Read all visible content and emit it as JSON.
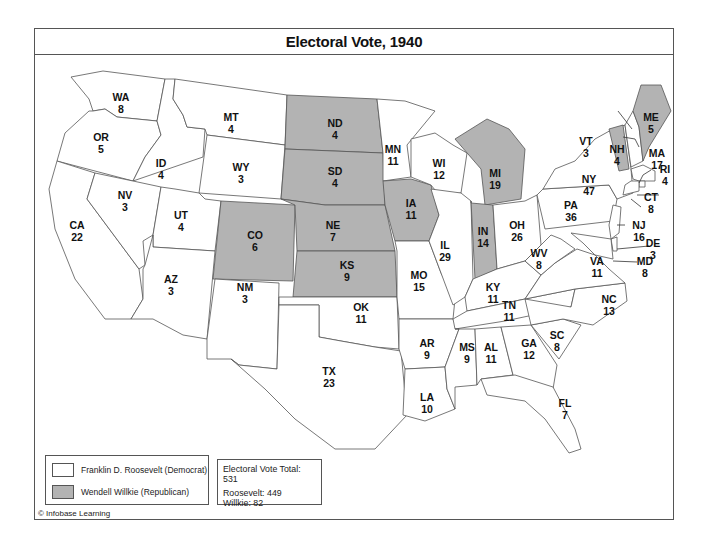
{
  "title": "Electoral Vote, 1940",
  "colors": {
    "democrat": "#ffffff",
    "republican": "#b3b3b3",
    "border": "#555555"
  },
  "legend": {
    "items": [
      {
        "label": "Franklin D. Roosevelt (Democrat)",
        "color": "#ffffff"
      },
      {
        "label": "Wendell Willkie (Republican)",
        "color": "#b3b3b3"
      }
    ]
  },
  "totals": {
    "total_label": "Electoral Vote Total: 531",
    "roosevelt_label": "Roosevelt: 449",
    "willkie_label": "Willkie: 82"
  },
  "credit": "© Infobase Learning",
  "states": [
    {
      "abbr": "WA",
      "votes": "8",
      "winner": "D"
    },
    {
      "abbr": "OR",
      "votes": "5",
      "winner": "D"
    },
    {
      "abbr": "CA",
      "votes": "22",
      "winner": "D"
    },
    {
      "abbr": "ID",
      "votes": "4",
      "winner": "D"
    },
    {
      "abbr": "NV",
      "votes": "3",
      "winner": "D"
    },
    {
      "abbr": "MT",
      "votes": "4",
      "winner": "D"
    },
    {
      "abbr": "WY",
      "votes": "3",
      "winner": "D"
    },
    {
      "abbr": "UT",
      "votes": "4",
      "winner": "D"
    },
    {
      "abbr": "AZ",
      "votes": "3",
      "winner": "D"
    },
    {
      "abbr": "CO",
      "votes": "6",
      "winner": "R"
    },
    {
      "abbr": "NM",
      "votes": "3",
      "winner": "D"
    },
    {
      "abbr": "ND",
      "votes": "4",
      "winner": "R"
    },
    {
      "abbr": "SD",
      "votes": "4",
      "winner": "R"
    },
    {
      "abbr": "NE",
      "votes": "7",
      "winner": "R"
    },
    {
      "abbr": "KS",
      "votes": "9",
      "winner": "R"
    },
    {
      "abbr": "OK",
      "votes": "11",
      "winner": "D"
    },
    {
      "abbr": "TX",
      "votes": "23",
      "winner": "D"
    },
    {
      "abbr": "MN",
      "votes": "11",
      "winner": "D"
    },
    {
      "abbr": "IA",
      "votes": "11",
      "winner": "R"
    },
    {
      "abbr": "MO",
      "votes": "15",
      "winner": "D"
    },
    {
      "abbr": "AR",
      "votes": "9",
      "winner": "D"
    },
    {
      "abbr": "LA",
      "votes": "10",
      "winner": "D"
    },
    {
      "abbr": "WI",
      "votes": "12",
      "winner": "D"
    },
    {
      "abbr": "IL",
      "votes": "29",
      "winner": "D"
    },
    {
      "abbr": "MI",
      "votes": "19",
      "winner": "R"
    },
    {
      "abbr": "IN",
      "votes": "14",
      "winner": "R"
    },
    {
      "abbr": "OH",
      "votes": "26",
      "winner": "D"
    },
    {
      "abbr": "KY",
      "votes": "11",
      "winner": "D"
    },
    {
      "abbr": "TN",
      "votes": "11",
      "winner": "D"
    },
    {
      "abbr": "MS",
      "votes": "9",
      "winner": "D"
    },
    {
      "abbr": "AL",
      "votes": "11",
      "winner": "D"
    },
    {
      "abbr": "GA",
      "votes": "12",
      "winner": "D"
    },
    {
      "abbr": "FL",
      "votes": "7",
      "winner": "D"
    },
    {
      "abbr": "SC",
      "votes": "8",
      "winner": "D"
    },
    {
      "abbr": "NC",
      "votes": "13",
      "winner": "D"
    },
    {
      "abbr": "VA",
      "votes": "11",
      "winner": "D"
    },
    {
      "abbr": "WV",
      "votes": "8",
      "winner": "D"
    },
    {
      "abbr": "PA",
      "votes": "36",
      "winner": "D"
    },
    {
      "abbr": "NY",
      "votes": "47",
      "winner": "D"
    },
    {
      "abbr": "VT",
      "votes": "3",
      "winner": "R"
    },
    {
      "abbr": "NH",
      "votes": "4",
      "winner": "D"
    },
    {
      "abbr": "ME",
      "votes": "5",
      "winner": "R"
    },
    {
      "abbr": "MA",
      "votes": "17",
      "winner": "D"
    },
    {
      "abbr": "RI",
      "votes": "4",
      "winner": "D"
    },
    {
      "abbr": "CT",
      "votes": "8",
      "winner": "D"
    },
    {
      "abbr": "NJ",
      "votes": "16",
      "winner": "D"
    },
    {
      "abbr": "DE",
      "votes": "3",
      "winner": "D"
    },
    {
      "abbr": "MD",
      "votes": "8",
      "winner": "D"
    }
  ]
}
